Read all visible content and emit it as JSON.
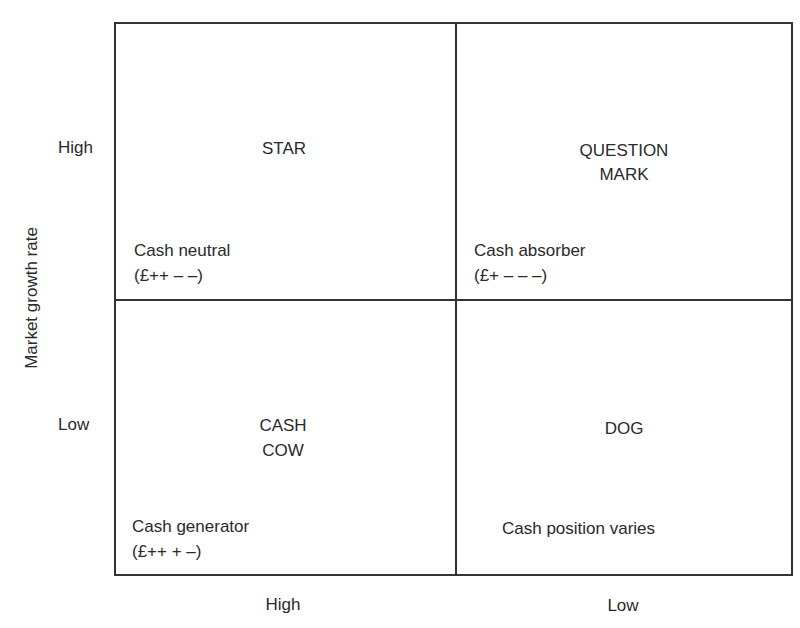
{
  "diagram": {
    "type": "bcg-matrix",
    "y_axis": {
      "label": "Market growth rate",
      "high": "High",
      "low": "Low"
    },
    "x_axis": {
      "high": "High",
      "low": "Low"
    },
    "quadrants": {
      "star": {
        "title_line1": "STAR",
        "title_line2": "",
        "cash_label": "Cash neutral",
        "cash_code": "(£++ – –)"
      },
      "question_mark": {
        "title_line1": "QUESTION",
        "title_line2": "MARK",
        "cash_label": "Cash absorber",
        "cash_code": "(£+ – – –)"
      },
      "cash_cow": {
        "title_line1": "CASH",
        "title_line2": "COW",
        "cash_label": "Cash generator",
        "cash_code": "(£++ + –)"
      },
      "dog": {
        "title_line1": "DOG",
        "title_line2": "",
        "cash_label": "Cash position varies",
        "cash_code": ""
      }
    }
  }
}
